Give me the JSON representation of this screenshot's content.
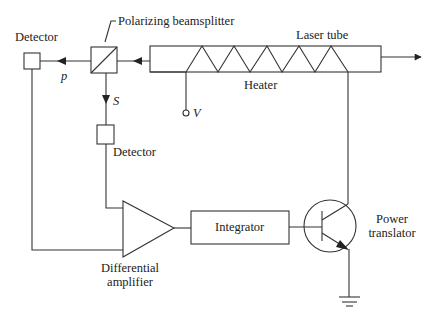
{
  "diagram": {
    "type": "block-diagram",
    "labels": {
      "polarizing_beamsplitter": "Polarizing beamsplitter",
      "laser_tube": "Laser tube",
      "heater": "Heater",
      "detector_p": "Detector",
      "detector_s": "Detector",
      "p_beam": "p",
      "s_beam": "S",
      "voltage": "V",
      "differential_amplifier_line1": "Differential",
      "differential_amplifier_line2": "amplifier",
      "integrator": "Integrator",
      "power_transistor_line1": "Power",
      "power_transistor_line2": "translator"
    },
    "nodes": [
      {
        "id": "laser-tube",
        "label": "Laser tube"
      },
      {
        "id": "heater",
        "label": "Heater"
      },
      {
        "id": "polarizing-beamsplitter",
        "label": "Polarizing beamsplitter"
      },
      {
        "id": "detector-p",
        "label": "Detector"
      },
      {
        "id": "detector-s",
        "label": "Detector"
      },
      {
        "id": "differential-amplifier",
        "label": "Differential amplifier"
      },
      {
        "id": "integrator",
        "label": "Integrator"
      },
      {
        "id": "power-transistor",
        "label": "Power translator"
      },
      {
        "id": "ground",
        "label": ""
      },
      {
        "id": "voltage-terminal",
        "label": "V"
      }
    ],
    "edges": [
      {
        "from": "laser-tube",
        "to": "polarizing-beamsplitter"
      },
      {
        "from": "polarizing-beamsplitter",
        "to": "detector-p",
        "label": "p"
      },
      {
        "from": "polarizing-beamsplitter",
        "to": "detector-s",
        "label": "S"
      },
      {
        "from": "detector-s",
        "to": "differential-amplifier"
      },
      {
        "from": "detector-p",
        "to": "differential-amplifier"
      },
      {
        "from": "differential-amplifier",
        "to": "integrator"
      },
      {
        "from": "integrator",
        "to": "power-transistor"
      },
      {
        "from": "power-transistor",
        "to": "heater"
      },
      {
        "from": "power-transistor",
        "to": "ground"
      },
      {
        "from": "voltage-terminal",
        "to": "heater"
      }
    ]
  }
}
